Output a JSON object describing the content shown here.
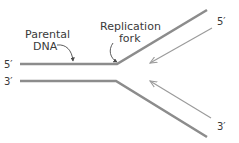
{
  "diagram": {
    "labels": {
      "parental_line1": "Parental",
      "parental_line2": "DNA",
      "fork_line1": "Replication",
      "fork_line2": "fork"
    },
    "ends": {
      "top_left": "5′",
      "bottom_left": "3′",
      "top_right": "5′",
      "bottom_right": "3′"
    },
    "colors": {
      "strand": "#8c8c8c",
      "arrow": "#9a9a9a",
      "text": "#3a3a3a"
    }
  }
}
